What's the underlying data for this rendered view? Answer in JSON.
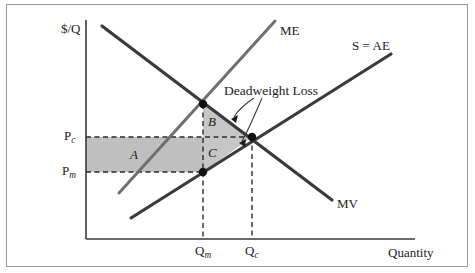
{
  "figure": {
    "type": "economics-diagram",
    "topic": "Monopoly deadweight loss",
    "background_color": "#ffffff",
    "outer_background_color": "#e8e8e8",
    "border_color": "#9a9a9a"
  },
  "axes": {
    "y_label": "$/Q",
    "x_label": "Quantity",
    "axis_color": "#3a3a3a",
    "origin_px": [
      86,
      239
    ],
    "y_top_px": 20,
    "x_right_px": 415
  },
  "curves": [
    {
      "id": "mv",
      "label": "MV",
      "description": "Marginal Value / demand curve, downward sloping",
      "color": "#3a3a3a",
      "width": 3.2,
      "x1": 102,
      "y1": 26,
      "x2": 332,
      "y2": 200,
      "label_x": 337,
      "label_y": 203
    },
    {
      "id": "me",
      "label": "ME",
      "description": "Marginal Expenditure curve, upward sloping steeply",
      "color": "#6f6f6f",
      "width": 3.0,
      "x1": 119,
      "y1": 193,
      "x2": 275,
      "y2": 21,
      "label_x": 280,
      "label_y": 30
    },
    {
      "id": "s-ae",
      "label": "S = AE",
      "label_prefix": "S",
      "label_suffix": "AE",
      "label_operator": "=",
      "description": "Supply equals Average Expenditure, upward sloping",
      "color": "#3a3a3a",
      "width": 3.2,
      "x1": 131,
      "y1": 218,
      "x2": 391,
      "y2": 54,
      "label_x": 352,
      "label_y": 45
    }
  ],
  "points": [
    {
      "id": "monopsony-point",
      "x": 203,
      "y": 104,
      "r": 4.2,
      "color": "#111111"
    },
    {
      "id": "competitive-point",
      "x": 252,
      "y": 137,
      "r": 4.2,
      "color": "#111111"
    },
    {
      "id": "monopsony-price-point",
      "x": 203,
      "y": 172,
      "r": 4.2,
      "color": "#111111"
    }
  ],
  "price_lines": [
    {
      "id": "pc",
      "label": "P",
      "subscript": "c",
      "y": 137,
      "x_from": 86,
      "x_to": 252,
      "label_x": 66,
      "label_y": 130
    },
    {
      "id": "pm",
      "label": "P",
      "subscript": "m",
      "y": 172,
      "x_from": 86,
      "x_to": 203,
      "label_x": 64,
      "label_y": 165
    }
  ],
  "quantity_lines": [
    {
      "id": "qm",
      "label": "Q",
      "subscript": "m",
      "x": 203,
      "y_from": 104,
      "y_to": 239,
      "label_x": 196,
      "label_y": 245
    },
    {
      "id": "qc",
      "label": "Q",
      "subscript": "c",
      "x": 252,
      "y_from": 137,
      "y_to": 239,
      "label_x": 246,
      "label_y": 245
    }
  ],
  "regions": [
    {
      "id": "region-a",
      "label": "A",
      "shape": "rect",
      "description": "Transfer from sellers to monopsonist",
      "fill": "#bfbfbf",
      "x": 86,
      "y": 137,
      "w": 117,
      "h": 35,
      "label_x": 131,
      "label_y": 148
    },
    {
      "id": "region-b",
      "label": "B",
      "shape": "triangle",
      "description": "Deadweight loss above competitive price",
      "fill": "#c6c6c6",
      "points": "203,104 252,137 203,137",
      "label_x": 209,
      "label_y": 116
    },
    {
      "id": "region-c",
      "label": "C",
      "shape": "triangle",
      "description": "Deadweight loss below competitive price",
      "fill": "#c6c6c6",
      "points": "203,137 252,137 203,172",
      "label_x": 209,
      "label_y": 148
    }
  ],
  "annotation": {
    "text": "Deadweight Loss",
    "text_x": 226,
    "text_y": 89,
    "leader_color": "#3a3a3a",
    "arrows": [
      {
        "id": "arrow-to-b",
        "target_x": 231,
        "target_y": 119
      },
      {
        "id": "arrow-to-c",
        "target_x": 239,
        "target_y": 143
      }
    ]
  }
}
